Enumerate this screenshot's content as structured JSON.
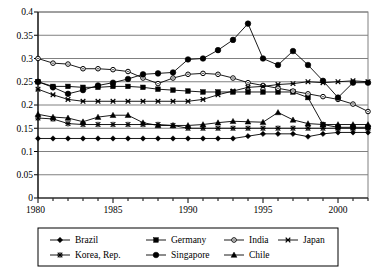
{
  "chart_data": {
    "type": "line",
    "title": "",
    "xlabel": "",
    "ylabel": "",
    "xlim": [
      1980,
      2002
    ],
    "ylim": [
      0,
      0.4
    ],
    "grid": true,
    "legend_position": "bottom",
    "y_ticks": [
      "0",
      "0.05",
      "0.1",
      "0.15",
      "0.2",
      "0.25",
      "0.3",
      "0.35",
      "0.4"
    ],
    "y_tick_values": [
      0,
      0.05,
      0.1,
      0.15,
      0.2,
      0.25,
      0.3,
      0.35,
      0.4
    ],
    "x_ticks": [
      "1980",
      "1985",
      "1990",
      "1995",
      "2000"
    ],
    "x_tick_values": [
      1980,
      1985,
      1990,
      1995,
      2000
    ],
    "x": [
      1980,
      1981,
      1982,
      1983,
      1984,
      1985,
      1986,
      1987,
      1988,
      1989,
      1990,
      1991,
      1992,
      1993,
      1994,
      1995,
      1996,
      1997,
      1998,
      1999,
      2000,
      2001,
      2002
    ],
    "series": [
      {
        "name": "Brazil",
        "marker": "diamond",
        "values": [
          0.128,
          0.128,
          0.128,
          0.128,
          0.128,
          0.128,
          0.128,
          0.128,
          0.128,
          0.128,
          0.128,
          0.128,
          0.128,
          0.128,
          0.133,
          0.138,
          0.138,
          0.138,
          0.132,
          0.138,
          0.141,
          0.141,
          0.141
        ]
      },
      {
        "name": "Germany",
        "marker": "square",
        "values": [
          0.25,
          0.24,
          0.24,
          0.238,
          0.238,
          0.24,
          0.24,
          0.238,
          0.234,
          0.232,
          0.23,
          0.228,
          0.228,
          0.228,
          0.228,
          0.228,
          0.228,
          0.228,
          0.216,
          0.158,
          0.152,
          0.152,
          0.152
        ]
      },
      {
        "name": "India",
        "marker": "circle-open",
        "values": [
          0.3,
          0.29,
          0.288,
          0.278,
          0.278,
          0.276,
          0.272,
          0.258,
          0.246,
          0.258,
          0.266,
          0.268,
          0.266,
          0.258,
          0.248,
          0.242,
          0.236,
          0.23,
          0.224,
          0.218,
          0.212,
          0.202,
          0.186
        ]
      },
      {
        "name": "Japan",
        "marker": "x",
        "values": [
          0.234,
          0.222,
          0.212,
          0.208,
          0.208,
          0.208,
          0.208,
          0.208,
          0.208,
          0.208,
          0.208,
          0.212,
          0.222,
          0.23,
          0.238,
          0.24,
          0.244,
          0.246,
          0.25,
          0.248,
          0.25,
          0.252,
          0.25
        ]
      },
      {
        "name": "Korea, Rep.",
        "marker": "star",
        "values": [
          0.172,
          0.17,
          0.16,
          0.158,
          0.158,
          0.158,
          0.158,
          0.158,
          0.158,
          0.156,
          0.15,
          0.15,
          0.15,
          0.15,
          0.15,
          0.15,
          0.15,
          0.15,
          0.15,
          0.15,
          0.15,
          0.15,
          0.15
        ]
      },
      {
        "name": "Singapore",
        "marker": "circle-filled",
        "values": [
          0.25,
          0.238,
          0.224,
          0.232,
          0.242,
          0.248,
          0.256,
          0.266,
          0.268,
          0.27,
          0.298,
          0.3,
          0.318,
          0.34,
          0.375,
          0.3,
          0.286,
          0.316,
          0.286,
          0.252,
          0.216,
          0.248,
          0.248
        ]
      },
      {
        "name": "Chile",
        "marker": "triangle",
        "values": [
          0.18,
          0.174,
          0.172,
          0.164,
          0.174,
          0.178,
          0.178,
          0.162,
          0.156,
          0.156,
          0.156,
          0.158,
          0.162,
          0.165,
          0.164,
          0.163,
          0.184,
          0.168,
          0.16,
          0.158,
          0.158,
          0.158,
          0.158
        ]
      }
    ],
    "legend": [
      {
        "label": "Brazil",
        "marker": "diamond"
      },
      {
        "label": "Germany",
        "marker": "square"
      },
      {
        "label": "India",
        "marker": "circle-open"
      },
      {
        "label": "Japan",
        "marker": "x"
      },
      {
        "label": "Korea, Rep.",
        "marker": "star"
      },
      {
        "label": "Singapore",
        "marker": "circle-filled"
      },
      {
        "label": "Chile",
        "marker": "triangle"
      }
    ],
    "colors": {
      "line": "#000000",
      "grid": "#808080",
      "axis": "#000000",
      "background": "#ffffff"
    }
  }
}
